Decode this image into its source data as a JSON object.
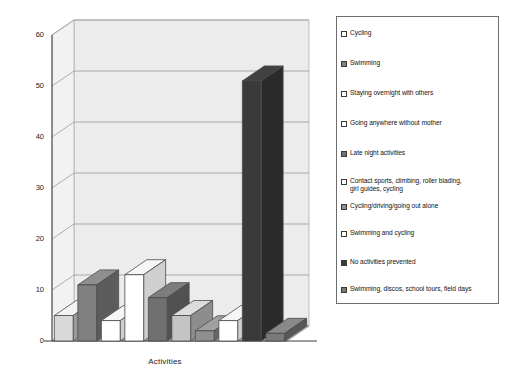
{
  "chart": {
    "type": "bar",
    "title": "",
    "xlabel": "Activities",
    "ylabel": ""
  },
  "axis": {
    "y_ticks": [
      "0",
      "10",
      "20",
      "30",
      "40",
      "50",
      "60"
    ],
    "x_title": "Activities"
  },
  "legend": {
    "items": [
      {
        "label": "Cycling",
        "swatch": "light",
        "color": "#d9d9d9"
      },
      {
        "label": "Swimming",
        "swatch": "dark",
        "color": "#808080"
      },
      {
        "label": "Staying overnight with others",
        "swatch": "light",
        "color": "#ffffff"
      },
      {
        "label": "Going anywhere without mother",
        "swatch": "light",
        "color": "#ffffff"
      },
      {
        "label": "Late night activities",
        "swatch": "dark",
        "color": "#707070"
      },
      {
        "label": "Contact sports, climbing, roller blading,\n    girl guides, cycling",
        "swatch": "light",
        "color": "#c4c4c4"
      },
      {
        "label": "Cycling/driving/going out alone",
        "swatch": "dark",
        "color": "#8f8f8f"
      },
      {
        "label": "Swimming and cycling",
        "swatch": "light",
        "color": "#ffffff"
      },
      {
        "label": "No activities prevented",
        "swatch": "dark",
        "color": "#3a3a3a"
      },
      {
        "label": "Swimming, discos, school tours, field days",
        "swatch": "dark",
        "color": "#7a7a7a"
      }
    ]
  },
  "chart_data": {
    "type": "bar",
    "title": "",
    "xlabel": "Activities",
    "ylabel": "",
    "ylim": [
      0,
      60
    ],
    "ytick_step": 10,
    "grid": true,
    "legend_position": "right",
    "categories": [
      "Cycling",
      "Swimming",
      "Staying overnight with others",
      "Going anywhere without mother",
      "Late night activities",
      "Contact sports, climbing, roller blading, girl guides, cycling",
      "Cycling/driving/going out alone",
      "Swimming and cycling",
      "No activities prevented",
      "Swimming, discos, school tours, field days"
    ],
    "values": [
      5,
      11,
      4,
      13,
      8.5,
      5,
      2,
      4,
      51,
      1.5
    ],
    "bar_colors": [
      "#d9d9d9",
      "#808080",
      "#ffffff",
      "#ffffff",
      "#707070",
      "#c4c4c4",
      "#8f8f8f",
      "#ffffff",
      "#3a3a3a",
      "#7a7a7a"
    ]
  },
  "colors": {
    "wall": "#ececec",
    "floor": "#b8b8b8",
    "gridline": "#9a9a9a",
    "outline": "#4a4a4a"
  }
}
